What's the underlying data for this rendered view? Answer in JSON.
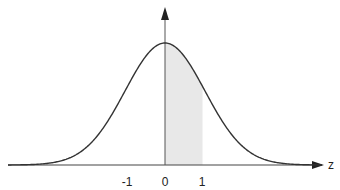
{
  "diagram": {
    "type": "normal-distribution-curve",
    "axis_label": "z",
    "ticks": [
      {
        "label": "-1",
        "value": -1
      },
      {
        "label": "0",
        "value": 0
      },
      {
        "label": "1",
        "value": 1
      }
    ],
    "shaded_region": {
      "from": 0,
      "to": 1,
      "color": "#e8e8e8"
    },
    "colors": {
      "curve": "#333333",
      "axis": "#444444",
      "shade": "#e8e8e8"
    }
  }
}
